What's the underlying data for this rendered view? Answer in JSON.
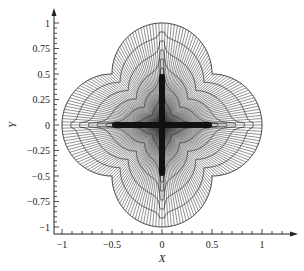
{
  "chart_data": {
    "type": "mesh",
    "title": "",
    "xlabel": "X",
    "ylabel": "Y",
    "xlim": [
      -1.0,
      1.2
    ],
    "ylim": [
      -1.0,
      1.05
    ],
    "x_ticks": [
      -1,
      -0.5,
      0,
      0.5,
      1
    ],
    "x_tick_labels": [
      "−1",
      "−0.5",
      "0",
      "0.5",
      "1"
    ],
    "y_ticks": [
      1,
      0.75,
      0.5,
      0.25,
      0,
      -0.25,
      -0.5,
      -0.75,
      -1
    ],
    "y_tick_labels": [
      "1",
      "0.75",
      "0.5",
      "0.25",
      "0",
      "−0.25",
      "−0.5",
      "−0.75",
      "−1"
    ],
    "minor_tick_step": 0.1,
    "grid": false,
    "domain_boundary": {
      "shape": "four-lobe",
      "lobe_centers": [
        [
          0.5,
          0
        ],
        [
          0,
          0.5
        ],
        [
          -0.5,
          0
        ],
        [
          0,
          -0.5
        ]
      ],
      "lobe_radius": 0.5,
      "axis_extent": 1.0,
      "pinch_points": [
        [
          0.5,
          0.5
        ],
        [
          -0.5,
          0.5
        ],
        [
          -0.5,
          -0.5
        ],
        [
          0.5,
          -0.5
        ]
      ]
    },
    "inner_slit": {
      "shape": "cross",
      "arm_length": 0.47
    },
    "mesh": {
      "contour_levels": 6,
      "ray_count": 200
    },
    "line_color": "#333333",
    "axis_color": "#222222"
  }
}
